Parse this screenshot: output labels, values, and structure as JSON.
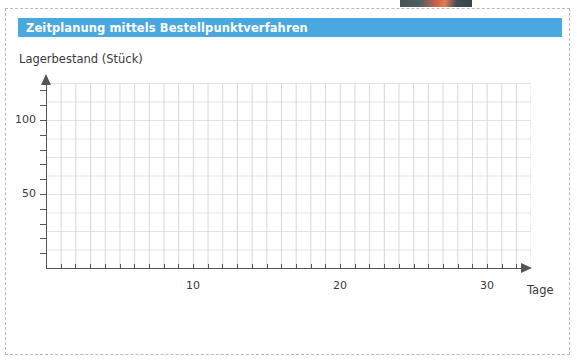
{
  "card": {
    "title": "Zeitplanung mittels Bestellpunktverfahren",
    "title_bar_color": "#4aa8e0",
    "title_text_color": "#ffffff",
    "border_style": "dashed",
    "border_color": "#b9b9b9"
  },
  "chart_data": {
    "type": "line",
    "title": "Zeitplanung mittels Bestellpunktverfahren",
    "subtitle": "",
    "xlabel": "Tage",
    "ylabel": "Lagerbestand (Stück)",
    "xlim": [
      0,
      32
    ],
    "ylim": [
      0,
      125
    ],
    "x_major_ticks": [
      10,
      20,
      30
    ],
    "x_major_tick_labels": [
      "10",
      "20",
      "30"
    ],
    "x_minor_tick_step": 1,
    "y_major_ticks": [
      50,
      100
    ],
    "y_major_tick_labels": [
      "50",
      "100"
    ],
    "y_minor_tick_step": 10,
    "grid": true,
    "grid_color_vertical": "#d6d6d6",
    "grid_color_horizontal": "#e2e2e2",
    "axis_color": "#555555",
    "axis_arrows": true,
    "legend": null,
    "series": [],
    "x": [],
    "values": [],
    "annotations": [],
    "note": "Empty worksheet grid — no data plotted; learner fills in the inventory curve."
  },
  "axes": {
    "y_caption": "Lagerbestand (Stück)",
    "x_caption": "Tage",
    "y_labels": [
      "100",
      "50"
    ],
    "x_labels": [
      "10",
      "20",
      "30"
    ]
  },
  "icons": {
    "x_axis_arrow": "arrow-right-icon",
    "y_axis_arrow": "arrow-up-icon"
  }
}
